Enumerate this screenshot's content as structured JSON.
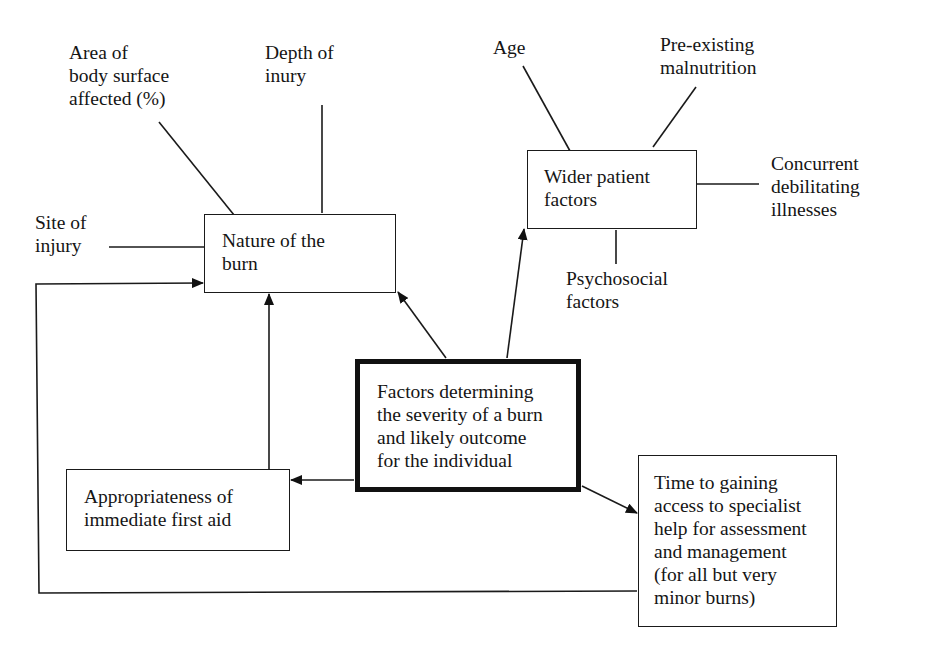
{
  "diagram": {
    "central": {
      "label": "Factors determining\nthe severity of a burn\nand likely outcome\nfor the individual"
    },
    "nodes": {
      "nature": {
        "label": "Nature of the\nburn"
      },
      "wider": {
        "label": "Wider patient\nfactors"
      },
      "first_aid": {
        "label": "Appropriateness of\nimmediate first aid"
      },
      "time": {
        "label": "Time to gaining\naccess to specialist\nhelp for assessment\nand management\n(for all but very\nminor burns)"
      }
    },
    "nature_factors": {
      "area": "Area of\nbody surface\naffected (%)",
      "depth": "Depth of\ninury",
      "site": "Site of\ninjury"
    },
    "wider_factors": {
      "age": "Age",
      "malnutrition": "Pre-existing\nmalnutrition",
      "illnesses": "Concurrent\ndebilitating\nillnesses",
      "psychosocial": "Psychosocial\nfactors"
    },
    "edges": [
      {
        "from": "central",
        "to": "nature",
        "arrow": true
      },
      {
        "from": "central",
        "to": "wider",
        "arrow": true
      },
      {
        "from": "central",
        "to": "first_aid",
        "arrow": true
      },
      {
        "from": "central",
        "to": "time",
        "arrow": true
      },
      {
        "from": "first_aid",
        "to": "nature",
        "arrow": true
      },
      {
        "from": "time",
        "to": "nature",
        "arrow": true,
        "routing": "loop-around-left"
      }
    ],
    "colors": {
      "line": "#111111",
      "background": "#ffffff"
    }
  }
}
